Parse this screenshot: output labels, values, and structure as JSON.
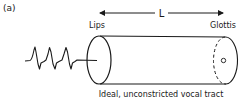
{
  "figure": {
    "panel_label": "(a)",
    "length_label": "L",
    "left_end_label": "Lips",
    "right_end_label": "Glottis",
    "caption": "Ideal, unconstricted vocal tract"
  },
  "colors": {
    "ink": "#1a1a1a",
    "background": "#ffffff"
  }
}
